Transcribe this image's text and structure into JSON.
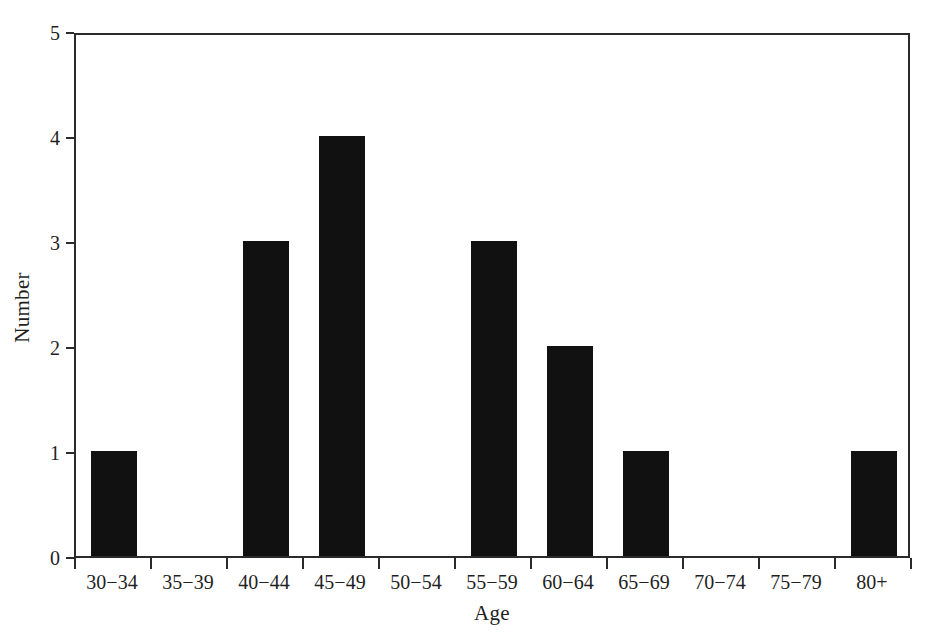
{
  "chart_data": {
    "type": "bar",
    "title": "",
    "subtitle": "",
    "xlabel": "Age",
    "ylabel": "Number",
    "categories": [
      "30−34",
      "35−39",
      "40−44",
      "45−49",
      "50−54",
      "55−59",
      "60−64",
      "65−69",
      "70−74",
      "75−79",
      "80+"
    ],
    "values": [
      1,
      0,
      3,
      4,
      0,
      3,
      2,
      1,
      0,
      0,
      1
    ],
    "ylim": [
      0,
      5
    ],
    "y_ticks": [
      0,
      1,
      2,
      3,
      4,
      5
    ],
    "y_tick_labels": [
      "0",
      "1",
      "2",
      "3",
      "4",
      "5"
    ],
    "grid": false,
    "legend": null,
    "bar_color": "#111111",
    "axis_color": "#2b2b2b",
    "background_color": "#ffffff",
    "annotations": []
  },
  "axes": {
    "y_title": "Number",
    "x_title": "Age"
  }
}
